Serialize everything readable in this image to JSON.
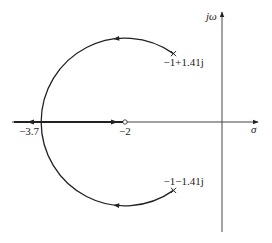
{
  "diagram": {
    "type": "root-locus",
    "axes": {
      "real_label": "σ",
      "imag_label": "jω"
    },
    "poles": [
      {
        "re": -1,
        "im": 1.41,
        "label": "−1+1.41j"
      },
      {
        "re": -1,
        "im": -1.41,
        "label": "−1−1.41j"
      }
    ],
    "zeros": [
      {
        "re": -2,
        "im": 0,
        "label": "−2"
      }
    ],
    "breakaway": {
      "re": -3.7,
      "label": "−3.7"
    },
    "locus_center": -2,
    "locus_radius": 1.73,
    "colors": {
      "line": "#222222",
      "axis": "#444444"
    }
  }
}
